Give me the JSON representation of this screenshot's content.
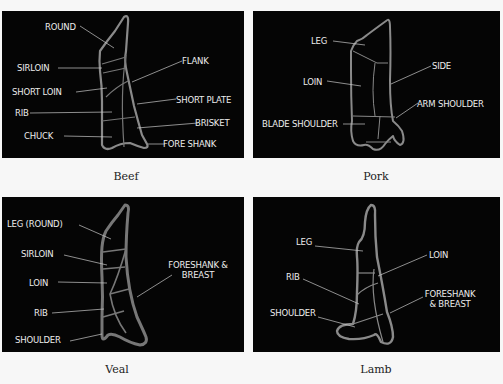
{
  "panels": {
    "beef": {
      "caption": "Beef",
      "labels": {
        "round": "ROUND",
        "sirloin": "SIRLOIN",
        "short_loin": "SHORT LOIN",
        "rib": "RIB",
        "chuck": "CHUCK",
        "flank": "FLANK",
        "short_plate": "SHORT PLATE",
        "brisket": "BRISKET",
        "fore_shank": "FORE SHANK"
      }
    },
    "pork": {
      "caption": "Pork",
      "labels": {
        "leg": "LEG",
        "loin": "LOIN",
        "blade_shoulder": "BLADE SHOULDER",
        "side": "SIDE",
        "arm_shoulder": "ARM SHOULDER"
      }
    },
    "veal": {
      "caption": "Veal",
      "labels": {
        "leg_round": "LEG (ROUND)",
        "sirloin": "SIRLOIN",
        "loin": "LOIN",
        "rib": "RIB",
        "shoulder": "SHOULDER",
        "foreshank_breast_1": "FORESHANK &",
        "foreshank_breast_2": "BREAST"
      }
    },
    "lamb": {
      "caption": "Lamb",
      "labels": {
        "leg": "LEG",
        "rib": "RIB",
        "shoulder": "SHOULDER",
        "loin": "LOIN",
        "foreshank_breast_1": "FORESHANK",
        "foreshank_breast_2": "& BREAST"
      }
    }
  },
  "colors": {
    "panel_bg": "#050505",
    "outline": "#8a8a8a",
    "label": "#ececec",
    "page_bg": "#f7f7f7"
  }
}
